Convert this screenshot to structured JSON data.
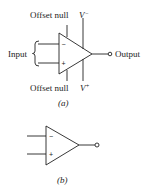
{
  "figure_a": {
    "caption": "(a)",
    "labels": {
      "offset_null_top": "Offset null",
      "v_minus": "V",
      "v_minus_sup": "−",
      "input": "Input",
      "output": "Output",
      "offset_null_bottom": "Offset null",
      "v_plus": "V",
      "v_plus_sup": "+"
    },
    "input_signs": {
      "inverting": "−",
      "non_inverting": "+"
    }
  },
  "figure_b": {
    "caption": "(b)",
    "input_signs": {
      "inverting": "−",
      "non_inverting": "+"
    }
  },
  "colors": {
    "stroke": "#222222",
    "background": "#ffffff"
  }
}
